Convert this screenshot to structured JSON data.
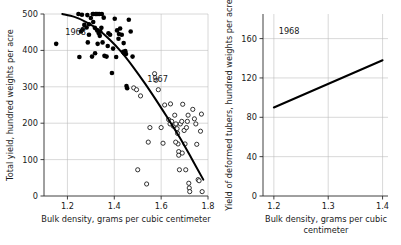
{
  "figure": {
    "background_color": "#ffffff",
    "text_color": "#1a1a1a",
    "grid_color": "#b9b9b9",
    "axis_color": "#2b2b2b",
    "curve_color": "#000000"
  },
  "chart_data": [
    {
      "id": "left-panel",
      "type": "scatter",
      "title": "",
      "xlabel": "Bulk density, grams per cubic centimeter",
      "ylabel": "Total yield, hundred weights per acre",
      "xlim": [
        1.1,
        1.8
      ],
      "ylim": [
        0,
        500
      ],
      "xticks": [
        1.2,
        1.4,
        1.6,
        1.8
      ],
      "xtick_labels": [
        "1.2",
        "1.4",
        "1.6",
        "1.8"
      ],
      "yticks": [
        0,
        100,
        200,
        300,
        400,
        500
      ],
      "ytick_labels": [
        "0",
        "100",
        "200",
        "300",
        "400",
        "500"
      ],
      "grid": true,
      "legend": "none",
      "annotations": [
        {
          "text": "1968",
          "x": 1.235,
          "y": 452
        },
        {
          "text": "1967",
          "x": 1.585,
          "y": 322
        }
      ],
      "series": [
        {
          "name": "1968",
          "marker": "filled-circle",
          "color": "#000000",
          "points": [
            [
              1.152,
              418
            ],
            [
              1.247,
              500
            ],
            [
              1.262,
              498
            ],
            [
              1.251,
              382
            ],
            [
              1.258,
              452
            ],
            [
              1.272,
              470
            ],
            [
              1.285,
              497
            ],
            [
              1.292,
              443
            ],
            [
              1.287,
              422
            ],
            [
              1.3,
              489
            ],
            [
              1.308,
              500
            ],
            [
              1.312,
              500
            ],
            [
              1.32,
              500
            ],
            [
              1.317,
              462
            ],
            [
              1.324,
              500
            ],
            [
              1.33,
              500
            ],
            [
              1.336,
              500
            ],
            [
              1.327,
              455
            ],
            [
              1.333,
              448
            ],
            [
              1.34,
              452
            ],
            [
              1.345,
              462
            ],
            [
              1.338,
              440
            ],
            [
              1.329,
              418
            ],
            [
              1.318,
              392
            ],
            [
              1.305,
              383
            ],
            [
              1.347,
              500
            ],
            [
              1.355,
              490
            ],
            [
              1.35,
              422
            ],
            [
              1.358,
              385
            ],
            [
              1.367,
              383
            ],
            [
              1.375,
              447
            ],
            [
              1.382,
              443
            ],
            [
              1.39,
              338
            ],
            [
              1.402,
              487
            ],
            [
              1.412,
              455
            ],
            [
              1.42,
              445
            ],
            [
              1.418,
              432
            ],
            [
              1.425,
              460
            ],
            [
              1.432,
              443
            ],
            [
              1.438,
              396
            ],
            [
              1.442,
              392
            ],
            [
              1.447,
              398
            ],
            [
              1.45,
              390
            ],
            [
              1.452,
              302
            ],
            [
              1.455,
              296
            ],
            [
              1.462,
              484
            ],
            [
              1.47,
              452
            ],
            [
              1.478,
              383
            ],
            [
              1.292,
              472
            ],
            [
              1.31,
              478
            ],
            [
              1.282,
              463
            ],
            [
              1.265,
              458
            ],
            [
              1.372,
              412
            ],
            [
              1.395,
              405
            ],
            [
              1.408,
              382
            ],
            [
              1.44,
              420
            ]
          ]
        },
        {
          "name": "1967",
          "marker": "open-circle",
          "color": "#111111",
          "points": [
            [
              1.483,
              297
            ],
            [
              1.495,
              292
            ],
            [
              1.5,
              72
            ],
            [
              1.512,
              275
            ],
            [
              1.538,
              33
            ],
            [
              1.545,
              148
            ],
            [
              1.552,
              188
            ],
            [
              1.572,
              336
            ],
            [
              1.578,
              318
            ],
            [
              1.588,
              292
            ],
            [
              1.6,
              188
            ],
            [
              1.608,
              145
            ],
            [
              1.615,
              250
            ],
            [
              1.632,
              210
            ],
            [
              1.638,
              198
            ],
            [
              1.645,
              205
            ],
            [
              1.652,
              192
            ],
            [
              1.658,
              222
            ],
            [
              1.663,
              198
            ],
            [
              1.668,
              185
            ],
            [
              1.67,
              172
            ],
            [
              1.672,
              143
            ],
            [
              1.675,
              122
            ],
            [
              1.675,
              112
            ],
            [
              1.678,
              72
            ],
            [
              1.682,
              198
            ],
            [
              1.688,
              205
            ],
            [
              1.692,
              252
            ],
            [
              1.698,
              180
            ],
            [
              1.702,
              143
            ],
            [
              1.705,
              72
            ],
            [
              1.708,
              188
            ],
            [
              1.712,
              205
            ],
            [
              1.715,
              222
            ],
            [
              1.718,
              35
            ],
            [
              1.72,
              22
            ],
            [
              1.722,
              12
            ],
            [
              1.735,
              238
            ],
            [
              1.742,
              212
            ],
            [
              1.748,
              198
            ],
            [
              1.752,
              142
            ],
            [
              1.758,
              45
            ],
            [
              1.762,
              42
            ],
            [
              1.768,
              178
            ],
            [
              1.772,
              225
            ],
            [
              1.775,
              12
            ],
            [
              1.662,
              148
            ],
            [
              1.69,
              118
            ],
            [
              1.64,
              253
            ]
          ]
        }
      ],
      "fit_curve": {
        "name": "fitted-trend",
        "points": [
          [
            1.178,
            500
          ],
          [
            1.23,
            492
          ],
          [
            1.28,
            478
          ],
          [
            1.33,
            458
          ],
          [
            1.38,
            430
          ],
          [
            1.43,
            396
          ],
          [
            1.48,
            355
          ],
          [
            1.53,
            310
          ],
          [
            1.58,
            262
          ],
          [
            1.63,
            212
          ],
          [
            1.68,
            160
          ],
          [
            1.73,
            103
          ],
          [
            1.78,
            45
          ]
        ]
      }
    },
    {
      "id": "right-panel",
      "type": "line",
      "title": "",
      "xlabel": "Bulk density, grams per cubic centimeter",
      "ylabel": "Yield of deformed tubers, hundred weights per acre",
      "xlim": [
        1.18,
        1.41
      ],
      "ylim": [
        0,
        185
      ],
      "xticks": [
        1.2,
        1.3,
        1.4
      ],
      "xtick_labels": [
        "1.2",
        "1.3",
        "1.4"
      ],
      "yticks": [
        0,
        40,
        80,
        120,
        160
      ],
      "ytick_labels": [
        "0",
        "40",
        "80",
        "120",
        "160"
      ],
      "grid": true,
      "legend": "none",
      "annotations": [
        {
          "text": "1968",
          "x": 1.228,
          "y": 168
        }
      ],
      "series": [
        {
          "name": "1968",
          "marker": "none",
          "color": "#000000",
          "points": [
            [
              1.2,
              90
            ],
            [
              1.4,
              138
            ]
          ]
        }
      ]
    }
  ]
}
